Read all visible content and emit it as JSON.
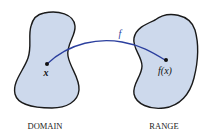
{
  "diagram": {
    "domain": {
      "label": "DOMAIN",
      "point_label": "x",
      "fill": "#cdd9ec",
      "stroke": "#1a1a1a"
    },
    "range": {
      "label": "RANGE",
      "point_label": "f(x)",
      "fill": "#cdd9ec",
      "stroke": "#1a1a1a"
    },
    "mapping": {
      "label": "f",
      "color": "#2b3f9e"
    }
  }
}
